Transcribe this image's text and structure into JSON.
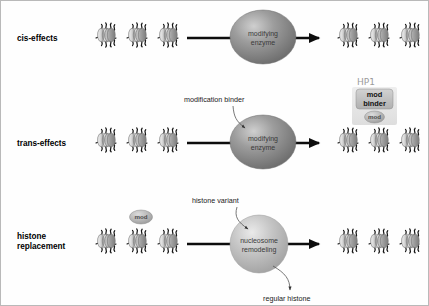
{
  "figure": {
    "background_color": "#fefefe",
    "border_color": "#b9b9b9",
    "width": 429,
    "height": 306
  },
  "rows": [
    {
      "id": "cis-effects",
      "label": "cis-effects",
      "label_lines": [
        "cis-effects"
      ],
      "input_nucleosomes": 3,
      "output_nucleosomes": 3,
      "effector": {
        "label_lines": [
          "modifying",
          "enzyme"
        ],
        "shape": "sphere",
        "color": "#8e8e8e"
      },
      "annotations": [],
      "marks": []
    },
    {
      "id": "trans-effects",
      "label": "trans-effects",
      "label_lines": [
        "trans-effects"
      ],
      "input_nucleosomes": 3,
      "output_nucleosomes": 3,
      "effector": {
        "label_lines": [
          "modifying",
          "enzyme"
        ],
        "shape": "sphere",
        "color": "#8e8e8e"
      },
      "annotations": [
        {
          "text": "modification binder",
          "points_to": "modifying-enzyme"
        }
      ],
      "marks": [
        {
          "type": "binder-box",
          "lines": [
            "mod",
            "binder"
          ],
          "badge": "mod",
          "handwritten_note": "HP1"
        }
      ]
    },
    {
      "id": "histone-replacement",
      "label_lines": [
        "histone",
        "replacement"
      ],
      "label": "histone replacement",
      "input_nucleosomes": 3,
      "output_nucleosomes": 3,
      "effector": {
        "label_lines": [
          "nucleosome",
          "remodeling"
        ],
        "shape": "sphere",
        "color": "#b3b3b3"
      },
      "annotations": [
        {
          "text": "histone variant",
          "points_to": "nucleosome-remodeling"
        },
        {
          "text": "regular histone",
          "points_to": "below-sphere"
        }
      ],
      "marks": [
        {
          "type": "mod-oval",
          "label": "mod"
        }
      ]
    }
  ],
  "glossary": {
    "mod": "mod",
    "mod_binder": "mod binder",
    "hp1": "HP1",
    "modifying_enzyme": "modifying enzyme",
    "nucleosome_remodeling": "nucleosome remodeling",
    "modification_binder": "modification binder",
    "histone_variant": "histone variant",
    "regular_histone": "regular histone"
  },
  "colors": {
    "nucleosome_light": "#e8e8e8",
    "nucleosome_mid": "#b4b4b4",
    "nucleosome_dark": "#7d7d7d",
    "dna": "#141414",
    "arrow": "#0d0d0d",
    "enzyme_sphere": "#8e8e8e",
    "remodel_sphere": "#b3b3b3",
    "binder_box": "#bdbdbd",
    "annotation_text": "#1a1a1a",
    "handwriting": "#9a9a9a"
  }
}
